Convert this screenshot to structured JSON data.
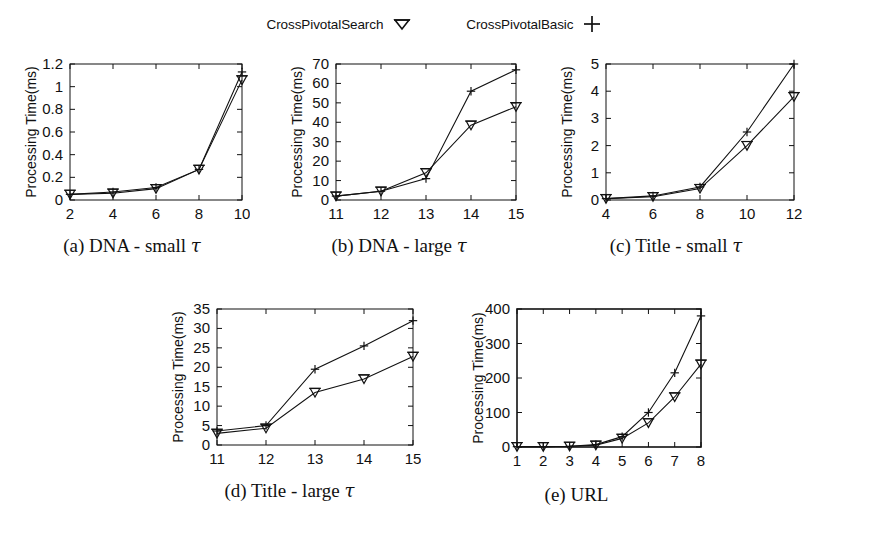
{
  "legend": {
    "entries": [
      {
        "label": "CrossPivotalSearch",
        "marker": "triangle-down-marker"
      },
      {
        "label": "CrossPivotalBasic",
        "marker": "plus-marker"
      }
    ]
  },
  "figure": {
    "y_axis_label": "Processing Time(ms)",
    "series_names": [
      "CrossPivotalSearch",
      "CrossPivotalBasic"
    ],
    "line_color": "#1a1a1a"
  },
  "chart_data": [
    {
      "id": "subplot-a",
      "type": "line",
      "caption_prefix": "(a)",
      "caption_text": "DNA - small",
      "caption_symbol": "τ",
      "title": "(a) DNA - small τ",
      "xlabel": "",
      "ylabel": "Processing Time(ms)",
      "x": [
        2,
        4,
        6,
        8,
        10
      ],
      "xticks": [
        "2",
        "4",
        "6",
        "8",
        "10"
      ],
      "yticks": [
        "0",
        "0.2",
        "0.4",
        "0.6",
        "0.8",
        "1",
        "1.2"
      ],
      "ytickvals": [
        0,
        0.2,
        0.4,
        0.6,
        0.8,
        1.0,
        1.2
      ],
      "xlim": [
        2,
        10
      ],
      "ylim": [
        0,
        1.2
      ],
      "grid": false,
      "series": [
        {
          "name": "CrossPivotalSearch",
          "marker": "triangle-down-marker",
          "values": [
            0.05,
            0.06,
            0.1,
            0.27,
            1.06
          ]
        },
        {
          "name": "CrossPivotalBasic",
          "marker": "plus-marker",
          "values": [
            0.05,
            0.07,
            0.11,
            0.27,
            1.13
          ]
        }
      ]
    },
    {
      "id": "subplot-b",
      "type": "line",
      "caption_prefix": "(b)",
      "caption_text": "DNA - large",
      "caption_symbol": "τ",
      "title": "(b) DNA - large τ",
      "xlabel": "",
      "ylabel": "Processing Time(ms)",
      "x": [
        11,
        12,
        13,
        14,
        15
      ],
      "xticks": [
        "11",
        "12",
        "13",
        "14",
        "15"
      ],
      "yticks": [
        "0",
        "10",
        "20",
        "30",
        "40",
        "50",
        "60",
        "70"
      ],
      "ytickvals": [
        0,
        10,
        20,
        30,
        40,
        50,
        60,
        70
      ],
      "xlim": [
        11,
        15
      ],
      "ylim": [
        0,
        70
      ],
      "grid": false,
      "series": [
        {
          "name": "CrossPivotalSearch",
          "marker": "triangle-down-marker",
          "values": [
            2,
            4.5,
            14,
            38.5,
            48
          ]
        },
        {
          "name": "CrossPivotalBasic",
          "marker": "plus-marker",
          "values": [
            2,
            4.5,
            11,
            56,
            67
          ]
        }
      ]
    },
    {
      "id": "subplot-c",
      "type": "line",
      "caption_prefix": "(c)",
      "caption_text": "Title - small",
      "caption_symbol": "τ",
      "title": "(c) Title - small τ",
      "xlabel": "",
      "ylabel": "Processing Time(ms)",
      "x": [
        4,
        6,
        8,
        10,
        12
      ],
      "xticks": [
        "4",
        "6",
        "8",
        "10",
        "12"
      ],
      "yticks": [
        "0",
        "1",
        "2",
        "3",
        "4",
        "5"
      ],
      "ytickvals": [
        0,
        1,
        2,
        3,
        4,
        5
      ],
      "xlim": [
        4,
        12
      ],
      "ylim": [
        0,
        5
      ],
      "grid": false,
      "series": [
        {
          "name": "CrossPivotalSearch",
          "marker": "triangle-down-marker",
          "values": [
            0.05,
            0.12,
            0.42,
            2.0,
            3.8
          ]
        },
        {
          "name": "CrossPivotalBasic",
          "marker": "plus-marker",
          "values": [
            0.05,
            0.15,
            0.48,
            2.5,
            5.0
          ]
        }
      ]
    },
    {
      "id": "subplot-d",
      "type": "line",
      "caption_prefix": "(d)",
      "caption_text": "Title - large",
      "caption_symbol": "τ",
      "title": "(d) Title - large τ",
      "xlabel": "",
      "ylabel": "Processing Time(ms)",
      "x": [
        11,
        12,
        13,
        14,
        15
      ],
      "xticks": [
        "11",
        "12",
        "13",
        "14",
        "15"
      ],
      "yticks": [
        "0",
        "5",
        "10",
        "15",
        "20",
        "25",
        "30",
        "35"
      ],
      "ytickvals": [
        0,
        5,
        10,
        15,
        20,
        25,
        30,
        35
      ],
      "xlim": [
        11,
        15
      ],
      "ylim": [
        0,
        35
      ],
      "grid": false,
      "series": [
        {
          "name": "CrossPivotalSearch",
          "marker": "triangle-down-marker",
          "values": [
            3.0,
            4.3,
            13.5,
            17.0,
            22.8
          ]
        },
        {
          "name": "CrossPivotalBasic",
          "marker": "plus-marker",
          "values": [
            3.6,
            5.0,
            19.5,
            25.5,
            32.0
          ]
        }
      ]
    },
    {
      "id": "subplot-e",
      "type": "line",
      "caption_prefix": "(e)",
      "caption_text": "URL",
      "caption_symbol": "",
      "title": "(e) URL",
      "xlabel": "",
      "ylabel": "Processing Time(ms)",
      "x": [
        1,
        2,
        3,
        4,
        5,
        6,
        7,
        8
      ],
      "xticks": [
        "1",
        "2",
        "3",
        "4",
        "5",
        "6",
        "7",
        "8"
      ],
      "yticks": [
        "0",
        "100",
        "200",
        "300",
        "400"
      ],
      "ytickvals": [
        0,
        100,
        200,
        300,
        400
      ],
      "xlim": [
        1,
        8
      ],
      "ylim": [
        0,
        400
      ],
      "grid": false,
      "series": [
        {
          "name": "CrossPivotalSearch",
          "marker": "triangle-down-marker",
          "values": [
            1,
            1,
            2,
            5,
            25,
            70,
            145,
            240
          ]
        },
        {
          "name": "CrossPivotalBasic",
          "marker": "plus-marker",
          "values": [
            1,
            1,
            2,
            7,
            30,
            100,
            215,
            380
          ]
        }
      ]
    }
  ]
}
